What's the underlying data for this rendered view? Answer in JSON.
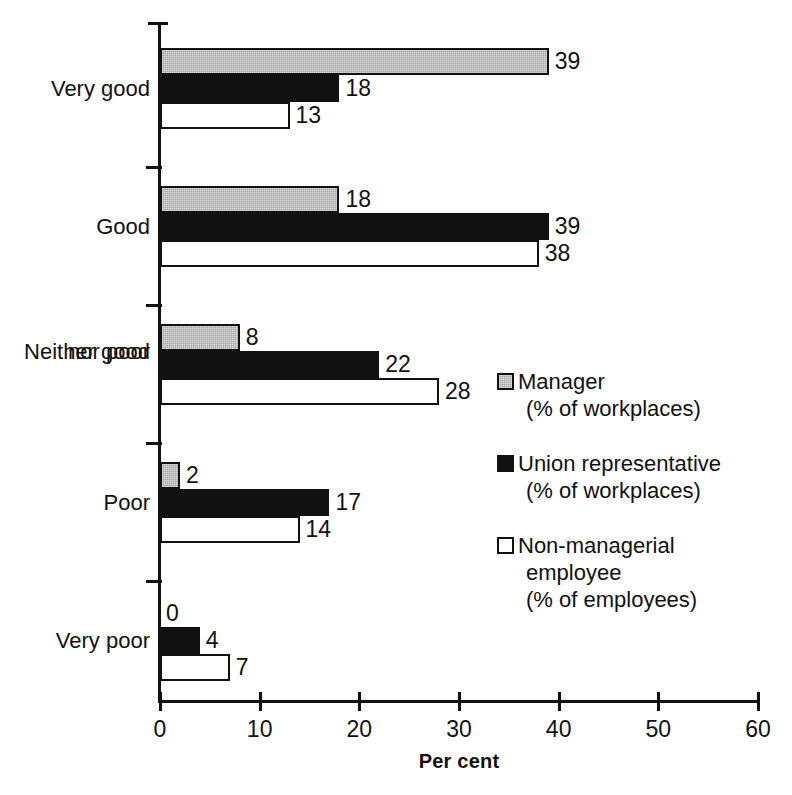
{
  "chart_data": {
    "type": "bar",
    "orientation": "horizontal",
    "title": "",
    "xlabel": "Per cent",
    "ylabel": "",
    "xlim": [
      0,
      60
    ],
    "xticks": [
      0,
      10,
      20,
      30,
      40,
      50,
      60
    ],
    "xtick_labels": [
      "0",
      "10",
      "20",
      "30",
      "40",
      "50",
      "60"
    ],
    "grid": false,
    "legend_position": "right-middle",
    "categories": [
      "Very good",
      "Good",
      "Neither good\nnor poor",
      "Poor",
      "Very poor"
    ],
    "category_labels": [
      {
        "line1": "Very good",
        "line2": ""
      },
      {
        "line1": "Good",
        "line2": ""
      },
      {
        "line1": "Neither good",
        "line2": "nor poor"
      },
      {
        "line1": "Poor",
        "line2": ""
      },
      {
        "line1": "Very poor",
        "line2": ""
      }
    ],
    "series": [
      {
        "name": "Manager",
        "sublabel": "(% of workplaces)",
        "color": "#a8a8a8",
        "values": [
          39,
          18,
          8,
          2,
          0
        ],
        "value_labels": [
          "39",
          "18",
          "8",
          "2",
          "0"
        ]
      },
      {
        "name": "Union representative",
        "sublabel": "(% of workplaces)",
        "color": "#111111",
        "values": [
          18,
          39,
          22,
          17,
          4
        ],
        "value_labels": [
          "18",
          "39",
          "22",
          "17",
          "4"
        ]
      },
      {
        "name": "Non-managerial employee",
        "sublabel": "(% of employees)",
        "color": "#ffffff",
        "values": [
          13,
          38,
          28,
          14,
          7
        ],
        "value_labels": [
          "13",
          "38",
          "28",
          "14",
          "7"
        ]
      }
    ]
  },
  "legend": {
    "entries": [
      {
        "label": "Manager",
        "sub": "(% of workplaces)",
        "swatch": "grey-square-icon"
      },
      {
        "label": "Union representative",
        "sub": "(% of workplaces)",
        "swatch": "black-square-icon"
      },
      {
        "label": "Non-managerial",
        "label2": "employee",
        "sub": "(% of employees)",
        "swatch": "white-square-icon"
      }
    ]
  },
  "axis": {
    "x_title": "Per cent"
  }
}
